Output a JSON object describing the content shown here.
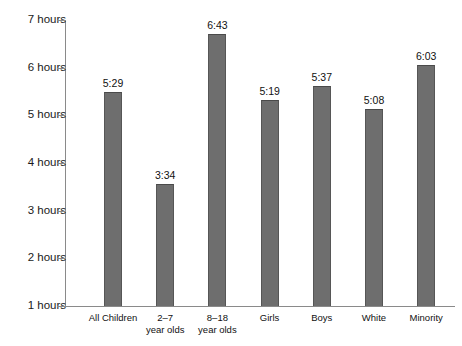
{
  "chart_data": {
    "type": "bar",
    "title": "",
    "subtitle": "",
    "xlabel": "",
    "ylabel": "",
    "categories": [
      "All Children",
      "2–7\nyear olds",
      "8–18\nyear olds",
      "Girls",
      "Boys",
      "White",
      "Minority"
    ],
    "values": [
      5.4833,
      3.5667,
      6.7167,
      5.3167,
      5.6167,
      5.1333,
      6.05
    ],
    "value_labels": [
      "5:29",
      "3:34",
      "6:43",
      "5:19",
      "5:37",
      "5:08",
      "6:03"
    ],
    "ylim": [
      1,
      7
    ],
    "y_ticks": [
      1,
      2,
      3,
      4,
      5,
      6,
      7
    ],
    "y_tick_labels": [
      "1 hours",
      "2 hours",
      "3 hours",
      "4 hours",
      "5 hours",
      "6 hours",
      "7 hours"
    ],
    "grid": false,
    "legend": false,
    "bar_color": "#6e6e6e",
    "axis_color": "#8a8a8a",
    "text_color": "#111111",
    "background_color": "#ffffff"
  }
}
